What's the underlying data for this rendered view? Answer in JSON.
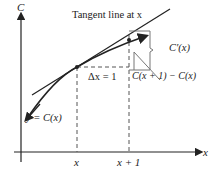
{
  "axes": {
    "y_label": "C",
    "x_label": "x"
  },
  "labels": {
    "tangent": "Tangent line at x",
    "delta_x": "Δx = 1",
    "derivative": "C′(x)",
    "difference": "C(x + 1) − C(x)",
    "curve": "y = C(x)",
    "tick_x": "x",
    "tick_x1": "x + 1"
  },
  "colors": {
    "line": "#222222",
    "guide": "#555555"
  }
}
